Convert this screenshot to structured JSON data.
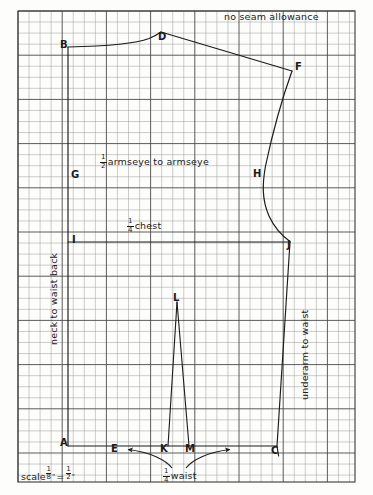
{
  "document": {
    "title": "Bodice back sloper draft",
    "background_color": "#fdfdfc",
    "ink_color": "#1b1b1b"
  },
  "grid": {
    "cell_px": 11.05,
    "minor_color": "#8d8d8d",
    "major_color": "#444444",
    "major_every": 4,
    "left": 18,
    "top": 11,
    "right": 355,
    "bottom": 482,
    "cols": 30,
    "rows": 42
  },
  "annotations": {
    "no_seam_allowance": "no seam allowance",
    "armseye_label": "armseye to armseye",
    "armseye_fraction": {
      "num": "1",
      "den": "2"
    },
    "chest_label": "chest",
    "chest_fraction": {
      "num": "1",
      "den": "4"
    },
    "waist_label": "waist",
    "waist_fraction": {
      "num": "1",
      "den": "4"
    },
    "neck_to_waist": "neck to waist back",
    "underarm_to_waist": "underarm to waist",
    "scale_prefix": "scale",
    "scale_left": {
      "num": "1",
      "den": "8",
      "unit": "\""
    },
    "scale_equals": "=",
    "scale_right": {
      "num": "1",
      "den": "2",
      "unit": "\""
    }
  },
  "points": [
    {
      "id": "B",
      "label": "B",
      "x": 68,
      "y": 47,
      "lx": 61,
      "ly": 42
    },
    {
      "id": "D",
      "label": "D",
      "x": 161,
      "y": 32,
      "lx": 159,
      "ly": 34
    },
    {
      "id": "F",
      "label": "F",
      "x": 292,
      "y": 71,
      "lx": 295,
      "ly": 66
    },
    {
      "id": "G",
      "label": "G",
      "x": 79,
      "y": 177,
      "lx": 72,
      "ly": 172
    },
    {
      "id": "H",
      "label": "H",
      "x": 262,
      "y": 175,
      "lx": 254,
      "ly": 171
    },
    {
      "id": "I",
      "label": "I",
      "x": 79,
      "y": 242,
      "lx": 73,
      "ly": 237
    },
    {
      "id": "J",
      "label": "J",
      "x": 290,
      "y": 242,
      "lx": 288,
      "ly": 244
    },
    {
      "id": "L",
      "label": "L",
      "x": 177,
      "y": 302,
      "lx": 174,
      "ly": 297
    },
    {
      "id": "A",
      "label": "A",
      "x": 68,
      "y": 446,
      "lx": 61,
      "ly": 441
    },
    {
      "id": "E",
      "label": "E",
      "x": 123,
      "y": 446,
      "lx": 112,
      "ly": 447
    },
    {
      "id": "K",
      "label": "K",
      "x": 168,
      "y": 446,
      "lx": 161,
      "ly": 447
    },
    {
      "id": "M",
      "label": "M",
      "x": 189,
      "y": 446,
      "lx": 186,
      "ly": 447
    },
    {
      "id": "C",
      "label": "C",
      "x": 277,
      "y": 446,
      "lx": 272,
      "ly": 449
    }
  ],
  "chart_data": {
    "type": "line",
    "xlabel": "",
    "ylabel": "",
    "grid": true,
    "series": [
      {
        "name": "neckline B to D",
        "kind": "curve",
        "points": [
          [
            68,
            47
          ],
          [
            110,
            45
          ],
          [
            140,
            39
          ],
          [
            161,
            32
          ]
        ]
      },
      {
        "name": "shoulder D to F",
        "kind": "straight",
        "points": [
          [
            161,
            32
          ],
          [
            292,
            71
          ]
        ]
      },
      {
        "name": "armhole F to H to J",
        "kind": "curve",
        "points": [
          [
            292,
            71
          ],
          [
            274,
            120
          ],
          [
            262,
            175
          ],
          [
            266,
            212
          ],
          [
            290,
            242
          ]
        ]
      },
      {
        "name": "side seam J to C",
        "kind": "straight",
        "points": [
          [
            290,
            242
          ],
          [
            277,
            446
          ]
        ]
      },
      {
        "name": "center back B to A",
        "kind": "construction",
        "points": [
          [
            68,
            47
          ],
          [
            68,
            446
          ]
        ]
      },
      {
        "name": "chest line I to J",
        "kind": "construction",
        "points": [
          [
            79,
            242
          ],
          [
            290,
            242
          ]
        ]
      },
      {
        "name": "waist line A to C",
        "kind": "construction",
        "points": [
          [
            68,
            446
          ],
          [
            277,
            446
          ]
        ]
      },
      {
        "name": "dart L-K-M",
        "kind": "dart",
        "points": [
          [
            168,
            446
          ],
          [
            177,
            302
          ],
          [
            189,
            446
          ]
        ]
      }
    ],
    "callout_arrows": [
      {
        "name": "waist-arrow-left",
        "from": [
          172,
          470
        ],
        "to": [
          126,
          450
        ]
      },
      {
        "name": "waist-arrow-right",
        "from": [
          186,
          470
        ],
        "to": [
          232,
          450
        ]
      }
    ]
  }
}
